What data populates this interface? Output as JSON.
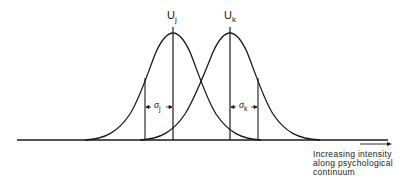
{
  "diagram": {
    "type": "overlapping-normal-distributions",
    "stroke_color": "#1a1a1a",
    "background": "#ffffff",
    "distributions": [
      {
        "id": "j",
        "mean_label": "U",
        "mean_subscript": "j",
        "sigma_label": "σ",
        "sigma_subscript": "j",
        "mean_x": 173,
        "sigma_x": 145
      },
      {
        "id": "k",
        "mean_label": "U",
        "mean_subscript": "k",
        "sigma_label": "σ",
        "sigma_subscript": "k",
        "mean_x": 230,
        "sigma_x": 258
      }
    ],
    "axis": {
      "label_lines": [
        "Increasing intensity",
        "along psychological",
        "continuum"
      ]
    }
  }
}
